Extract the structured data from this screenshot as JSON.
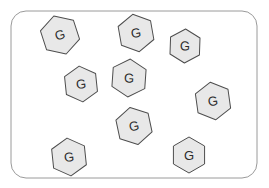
{
  "diagram": {
    "title": "",
    "container": {
      "name": "membrane-boundary",
      "shape": "rounded-rectangle",
      "x": 11,
      "y": 11,
      "width": 246,
      "height": 167,
      "corner_radius": 15,
      "fill_color": "#ffffff",
      "stroke_color": "#9a9a9a",
      "stroke_width": 1
    },
    "particle_style": {
      "shape": "hexagon",
      "fill_color": "#e8e8e8",
      "stroke_color": "#4d4d4d",
      "stroke_width": 1,
      "label_color": "#2b2b2b"
    },
    "particles": [
      {
        "id": "particle-1",
        "label": "G",
        "cx": 60,
        "cy": 35,
        "r": 20,
        "rotation": -18
      },
      {
        "id": "particle-2",
        "label": "G",
        "cx": 136,
        "cy": 33,
        "r": 19,
        "rotation": -10
      },
      {
        "id": "particle-3",
        "label": "G",
        "cx": 185,
        "cy": 46,
        "r": 17,
        "rotation": 2
      },
      {
        "id": "particle-4",
        "label": "G",
        "cx": 81,
        "cy": 84,
        "r": 18,
        "rotation": -6
      },
      {
        "id": "particle-5",
        "label": "G",
        "cx": 129,
        "cy": 78,
        "r": 19,
        "rotation": 4
      },
      {
        "id": "particle-6",
        "label": "G",
        "cx": 213,
        "cy": 101,
        "r": 19,
        "rotation": -8
      },
      {
        "id": "particle-7",
        "label": "G",
        "cx": 134,
        "cy": 126,
        "r": 19,
        "rotation": -12
      },
      {
        "id": "particle-8",
        "label": "G",
        "cx": 69,
        "cy": 157,
        "r": 19,
        "rotation": -6
      },
      {
        "id": "particle-9",
        "label": "G",
        "cx": 189,
        "cy": 155,
        "r": 18,
        "rotation": 0
      }
    ]
  }
}
